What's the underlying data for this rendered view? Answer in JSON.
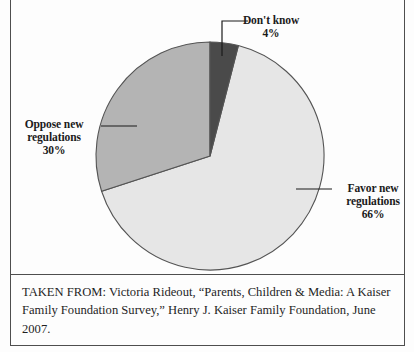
{
  "figure": {
    "background_color": "#fdfdfd",
    "frame_color": "#4e4e4e"
  },
  "chart_data": {
    "type": "pie",
    "title": "",
    "subtitle": "",
    "xlabel": "",
    "ylabel": "",
    "grid": false,
    "legend_position": "callout-labels",
    "start_angle_deg": 0,
    "direction": "clockwise",
    "center": {
      "x": 210,
      "y": 156
    },
    "radius": 114,
    "categories": [
      "Don't know",
      "Favor new regulations",
      "Oppose new regulations"
    ],
    "values": [
      4,
      66,
      30
    ],
    "value_suffix": "%",
    "colors": [
      "#4a4a4a",
      "#e6e6e6",
      "#b4b4b4"
    ],
    "outline_color": "#545454",
    "slices": [
      {
        "label": "Don't know",
        "label_line1": "Don't know",
        "label_line2": "",
        "value": 4,
        "value_text": "4%",
        "color": "#4a4a4a",
        "start_deg": 0,
        "end_deg": 14.4
      },
      {
        "label": "Favor new regulations",
        "label_line1": "Favor new",
        "label_line2": "regulations",
        "value": 66,
        "value_text": "66%",
        "color": "#e6e6e6",
        "start_deg": 14.4,
        "end_deg": 252.0
      },
      {
        "label": "Oppose new regulations",
        "label_line1": "Oppose new",
        "label_line2": "regulations",
        "value": 30,
        "value_text": "30%",
        "color": "#b4b4b4",
        "start_deg": 252.0,
        "end_deg": 360.0
      }
    ]
  },
  "caption": {
    "text": "TAKEN FROM: Victoria Rideout, “Parents, Children & Media: A Kaiser Family Foundation Survey,” Henry J. Kaiser Family Foundation, June 2007."
  }
}
